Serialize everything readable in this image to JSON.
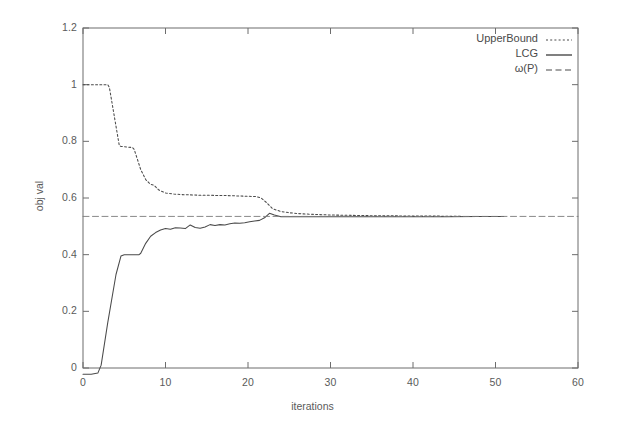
{
  "chart_data": {
    "type": "line",
    "title": "",
    "xlabel": "iterations",
    "ylabel": "obj val",
    "xlim": [
      0,
      60
    ],
    "ylim": [
      -0.05,
      1.2
    ],
    "xticks": [
      "0",
      "10",
      "20",
      "30",
      "40",
      "50",
      "60"
    ],
    "xtick_values": [
      0,
      10,
      20,
      30,
      40,
      50,
      60
    ],
    "yticks": [
      "0",
      "0.2",
      "0.4",
      "0.6",
      "0.8",
      "1",
      "1.2"
    ],
    "ytick_values": [
      0,
      0.2,
      0.4,
      0.6,
      0.8,
      1,
      1.2
    ],
    "grid": false,
    "legend_position": "top-right-inside",
    "series": [
      {
        "name": "UpperBound",
        "style": "dotted",
        "color": "#4a4a4a",
        "x": [
          0,
          1,
          2,
          3,
          3.2,
          4.4,
          4.6,
          6.0,
          6.2,
          7.0,
          7.6,
          8.2,
          8.6,
          9.2,
          10.0,
          11.0,
          12.0,
          13.0,
          14.0,
          15.0,
          16.0,
          17.0,
          18.0,
          19.0,
          20.0,
          21.0,
          21.6,
          22.2,
          23.0,
          24.0,
          25.0,
          26.0,
          28.0,
          30.0,
          32.0,
          34.0,
          36.0,
          38.0,
          40.0,
          43.0,
          46.0,
          49.0,
          51.0
        ],
        "y": [
          1.0,
          1.0,
          1.0,
          1.0,
          0.99,
          0.785,
          0.782,
          0.778,
          0.772,
          0.7,
          0.665,
          0.648,
          0.645,
          0.628,
          0.618,
          0.614,
          0.612,
          0.611,
          0.61,
          0.61,
          0.609,
          0.609,
          0.608,
          0.607,
          0.606,
          0.605,
          0.6,
          0.585,
          0.562,
          0.552,
          0.548,
          0.545,
          0.542,
          0.54,
          0.539,
          0.538,
          0.537,
          0.537,
          0.536,
          0.536,
          0.535,
          0.535,
          0.535
        ]
      },
      {
        "name": "LCG",
        "style": "solid",
        "color": "#4a4a4a",
        "x": [
          0,
          1.0,
          1.8,
          2.2,
          3.0,
          4.0,
          4.6,
          5.0,
          6.0,
          6.8,
          7.0,
          7.6,
          8.2,
          8.8,
          9.4,
          10.0,
          10.6,
          11.2,
          11.8,
          12.4,
          13.0,
          13.6,
          14.2,
          14.8,
          15.4,
          16.0,
          16.6,
          17.2,
          17.8,
          18.4,
          19.0,
          19.6,
          20.2,
          20.8,
          21.4,
          22.0,
          22.6,
          23.2,
          24.0,
          25.0,
          26.0,
          28.0,
          30.0,
          33.0,
          36.0,
          40.0,
          44.0,
          48.0,
          51.0
        ],
        "y": [
          -0.022,
          -0.022,
          -0.018,
          0.01,
          0.16,
          0.33,
          0.395,
          0.4,
          0.4,
          0.4,
          0.405,
          0.44,
          0.465,
          0.478,
          0.487,
          0.492,
          0.49,
          0.495,
          0.494,
          0.492,
          0.505,
          0.496,
          0.493,
          0.498,
          0.506,
          0.503,
          0.506,
          0.505,
          0.509,
          0.512,
          0.511,
          0.513,
          0.516,
          0.519,
          0.521,
          0.53,
          0.546,
          0.54,
          0.534,
          0.534,
          0.534,
          0.534,
          0.534,
          0.534,
          0.534,
          0.534,
          0.534,
          0.535,
          0.535
        ]
      },
      {
        "name": "ω(P)",
        "style": "dashed",
        "color": "#7a7a7a",
        "x": [
          0,
          60
        ],
        "y": [
          0.535,
          0.535
        ]
      }
    ]
  },
  "legend": {
    "items": [
      {
        "label": "UpperBound",
        "style": "dotted"
      },
      {
        "label": "LCG",
        "style": "solid"
      },
      {
        "label": "ω(P)",
        "style": "dashed"
      }
    ]
  },
  "axes": {
    "x_title": "iterations",
    "y_title": "obj val"
  }
}
